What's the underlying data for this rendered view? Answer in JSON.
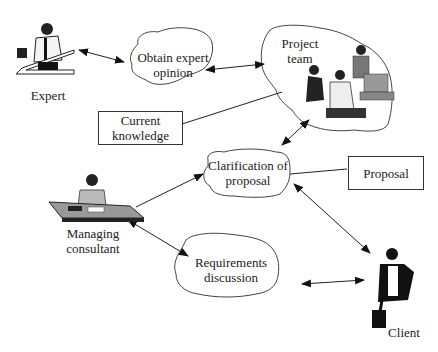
{
  "diagram": {
    "actors": {
      "expert": {
        "label": "Expert"
      },
      "managing_consultant": {
        "label_line1": "Managing",
        "label_line2": "consultant"
      },
      "client": {
        "label": "Client"
      },
      "project_team": {
        "label_line1": "Project",
        "label_line2": "team"
      }
    },
    "clouds": {
      "obtain_expert_opinion": {
        "line1": "Obtain expert",
        "line2": "opinion"
      },
      "clarification_of_proposal": {
        "line1": "Clarification of",
        "line2": "proposal"
      },
      "requirements_discussion": {
        "line1": "Requirements",
        "line2": "discussion"
      }
    },
    "boxes": {
      "current_knowledge": {
        "line1": "Current",
        "line2": "knowledge"
      },
      "proposal": {
        "line1": "Proposal"
      }
    },
    "connections": [
      {
        "from": "Expert",
        "to": "Obtain expert opinion",
        "type": "double-arrow"
      },
      {
        "from": "Obtain expert opinion",
        "to": "Project team",
        "type": "double-arrow"
      },
      {
        "from": "Current knowledge",
        "to": "Project team",
        "type": "line"
      },
      {
        "from": "Project team",
        "to": "Clarification of proposal",
        "type": "double-arrow"
      },
      {
        "from": "Managing consultant",
        "to": "Clarification of proposal",
        "type": "arrow"
      },
      {
        "from": "Proposal",
        "to": "Clarification of proposal",
        "type": "line"
      },
      {
        "from": "Clarification of proposal",
        "to": "Client",
        "type": "double-arrow"
      },
      {
        "from": "Managing consultant",
        "to": "Requirements discussion",
        "type": "double-arrow"
      },
      {
        "from": "Requirements discussion",
        "to": "Client",
        "type": "double-arrow"
      }
    ]
  }
}
